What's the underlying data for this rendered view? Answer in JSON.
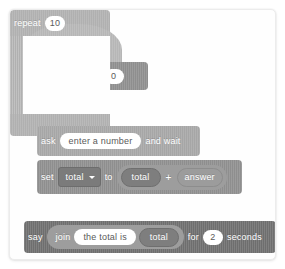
{
  "script": {
    "title": "Scratch script: sum of ten numbers",
    "blocks": {
      "hat": {
        "name": "when-flag-clicked",
        "word_when": "when",
        "flag_icon": "green-flag-icon",
        "word_clicked": "clicked"
      },
      "set_total_zero": {
        "name": "set-variable-to",
        "word_set": "set",
        "variable": "total",
        "word_to": "to",
        "value": "0"
      },
      "repeat": {
        "name": "repeat-loop",
        "word_repeat": "repeat",
        "times": "10",
        "loop_icon": "loop-arrow-icon"
      },
      "ask": {
        "name": "ask-and-wait",
        "word_ask": "ask",
        "question": "enter a number",
        "word_and_wait": "and wait"
      },
      "set_total_sum": {
        "name": "set-variable-to-sum",
        "word_set": "set",
        "variable": "total",
        "word_to": "to",
        "operand_left": "total",
        "operator": "+",
        "operand_right": "answer"
      },
      "say": {
        "name": "say-for-seconds",
        "word_say": "say",
        "word_join": "join",
        "join_text": "the total is",
        "join_variable": "total",
        "word_for": "for",
        "seconds": "2",
        "word_seconds": "seconds"
      }
    },
    "colors": {
      "canvas_background": "#fefefe",
      "hat_block": "#b6b6b6",
      "variable_block": "#8e8e8e",
      "control_block": "#b0b0b0",
      "sensing_block": "#a6a6a6",
      "looks_block": "#6e6e6e",
      "operator_block": "#9d9d9d",
      "input_field": "#ffffff",
      "text": "#ffffff"
    }
  }
}
